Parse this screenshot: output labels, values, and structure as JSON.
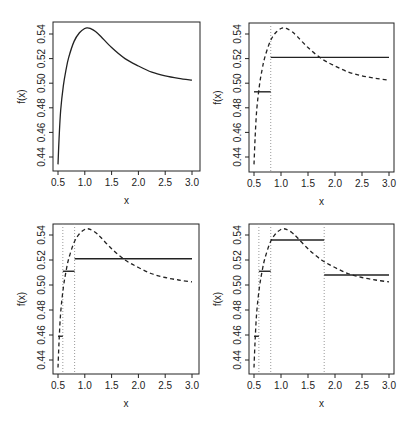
{
  "figure": {
    "layout": "2x2 grid of panels",
    "xlabel": "x",
    "ylabel": "f(x)"
  },
  "chart_data": [
    {
      "type": "line",
      "panel": "top-left",
      "title": "",
      "xlabel": "x",
      "ylabel": "f(x)",
      "xlim": [
        0.5,
        3.0
      ],
      "ylim": [
        0.433,
        0.548
      ],
      "xticks": [
        0.5,
        1.0,
        1.5,
        2.0,
        2.5,
        3.0
      ],
      "xtick_labels": [
        "0.5",
        "1.0",
        "1.5",
        "2.0",
        "2.5",
        "3.0"
      ],
      "yticks": [
        0.44,
        0.46,
        0.48,
        0.5,
        0.52,
        0.54
      ],
      "ytick_labels": [
        "0.44",
        "0.46",
        "0.48",
        "0.50",
        "0.52",
        "0.54"
      ],
      "grid": false,
      "curve_style": "solid",
      "curve": {
        "x": [
          0.5,
          0.52,
          0.55,
          0.6,
          0.65,
          0.7,
          0.8,
          0.9,
          1.0,
          1.05,
          1.1,
          1.2,
          1.3,
          1.5,
          1.75,
          2.0,
          2.25,
          2.5,
          2.75,
          3.0
        ],
        "y": [
          0.434,
          0.455,
          0.478,
          0.498,
          0.511,
          0.521,
          0.534,
          0.541,
          0.5445,
          0.545,
          0.5445,
          0.542,
          0.538,
          0.529,
          0.52,
          0.514,
          0.509,
          0.506,
          0.504,
          0.5025
        ]
      },
      "breaks": [],
      "steps": []
    },
    {
      "type": "line",
      "panel": "top-right",
      "title": "",
      "xlabel": "x",
      "ylabel": "f(x)",
      "xlim": [
        0.5,
        3.0
      ],
      "ylim": [
        0.433,
        0.548
      ],
      "xticks": [
        0.5,
        1.0,
        1.5,
        2.0,
        2.5,
        3.0
      ],
      "xtick_labels": [
        "0.5",
        "1.0",
        "1.5",
        "2.0",
        "2.5",
        "3.0"
      ],
      "yticks": [
        0.44,
        0.46,
        0.48,
        0.5,
        0.52,
        0.54
      ],
      "ytick_labels": [
        "0.44",
        "0.46",
        "0.48",
        "0.50",
        "0.52",
        "0.54"
      ],
      "grid": false,
      "curve_style": "dashed",
      "curve": {
        "x": [
          0.5,
          0.52,
          0.55,
          0.6,
          0.65,
          0.7,
          0.8,
          0.9,
          1.0,
          1.05,
          1.1,
          1.2,
          1.3,
          1.5,
          1.75,
          2.0,
          2.25,
          2.5,
          2.75,
          3.0
        ],
        "y": [
          0.434,
          0.455,
          0.478,
          0.498,
          0.511,
          0.521,
          0.534,
          0.541,
          0.5445,
          0.545,
          0.5445,
          0.542,
          0.538,
          0.529,
          0.52,
          0.514,
          0.509,
          0.506,
          0.504,
          0.5025
        ]
      },
      "breaks": [
        0.81
      ],
      "steps": [
        {
          "x0": 0.5,
          "x1": 0.81,
          "y": 0.493
        },
        {
          "x0": 0.81,
          "x1": 3.0,
          "y": 0.521
        }
      ]
    },
    {
      "type": "line",
      "panel": "bottom-left",
      "title": "",
      "xlabel": "x",
      "ylabel": "f(x)",
      "xlim": [
        0.5,
        3.0
      ],
      "ylim": [
        0.433,
        0.548
      ],
      "xticks": [
        0.5,
        1.0,
        1.5,
        2.0,
        2.5,
        3.0
      ],
      "xtick_labels": [
        "0.5",
        "1.0",
        "1.5",
        "2.0",
        "2.5",
        "3.0"
      ],
      "yticks": [
        0.44,
        0.46,
        0.48,
        0.5,
        0.52,
        0.54
      ],
      "ytick_labels": [
        "0.44",
        "0.46",
        "0.48",
        "0.50",
        "0.52",
        "0.54"
      ],
      "grid": false,
      "curve_style": "dashed",
      "curve": {
        "x": [
          0.5,
          0.52,
          0.55,
          0.6,
          0.65,
          0.7,
          0.8,
          0.9,
          1.0,
          1.05,
          1.1,
          1.2,
          1.3,
          1.5,
          1.75,
          2.0,
          2.25,
          2.5,
          2.75,
          3.0
        ],
        "y": [
          0.434,
          0.455,
          0.478,
          0.498,
          0.511,
          0.521,
          0.534,
          0.541,
          0.5445,
          0.545,
          0.5445,
          0.542,
          0.538,
          0.529,
          0.52,
          0.514,
          0.509,
          0.506,
          0.504,
          0.5025
        ]
      },
      "breaks": [
        0.59,
        0.81
      ],
      "steps": [
        {
          "x0": 0.5,
          "x1": 0.59,
          "y": 0.459
        },
        {
          "x0": 0.59,
          "x1": 0.81,
          "y": 0.511
        },
        {
          "x0": 0.81,
          "x1": 3.0,
          "y": 0.521
        }
      ]
    },
    {
      "type": "line",
      "panel": "bottom-right",
      "title": "",
      "xlabel": "x",
      "ylabel": "f(x)",
      "xlim": [
        0.5,
        3.0
      ],
      "ylim": [
        0.433,
        0.548
      ],
      "xticks": [
        0.5,
        1.0,
        1.5,
        2.0,
        2.5,
        3.0
      ],
      "xtick_labels": [
        "0.5",
        "1.0",
        "1.5",
        "2.0",
        "2.5",
        "3.0"
      ],
      "yticks": [
        0.44,
        0.46,
        0.48,
        0.5,
        0.52,
        0.54
      ],
      "ytick_labels": [
        "0.44",
        "0.46",
        "0.48",
        "0.50",
        "0.52",
        "0.54"
      ],
      "grid": false,
      "curve_style": "dashed",
      "curve": {
        "x": [
          0.5,
          0.52,
          0.55,
          0.6,
          0.65,
          0.7,
          0.8,
          0.9,
          1.0,
          1.05,
          1.1,
          1.2,
          1.3,
          1.5,
          1.75,
          2.0,
          2.25,
          2.5,
          2.75,
          3.0
        ],
        "y": [
          0.434,
          0.455,
          0.478,
          0.498,
          0.511,
          0.521,
          0.534,
          0.541,
          0.5445,
          0.545,
          0.5445,
          0.542,
          0.538,
          0.529,
          0.52,
          0.514,
          0.509,
          0.506,
          0.504,
          0.5025
        ]
      },
      "breaks": [
        0.59,
        0.81,
        1.8
      ],
      "steps": [
        {
          "x0": 0.5,
          "x1": 0.59,
          "y": 0.459
        },
        {
          "x0": 0.59,
          "x1": 0.81,
          "y": 0.511
        },
        {
          "x0": 0.81,
          "x1": 1.8,
          "y": 0.536
        },
        {
          "x0": 1.8,
          "x1": 3.0,
          "y": 0.508
        }
      ]
    }
  ],
  "panel_geometry": [
    {
      "box": [
        53,
        22,
        200,
        171
      ],
      "x_px": [
        58,
        192
      ],
      "y_px": [
        157,
        34
      ]
    },
    {
      "box": [
        249,
        23,
        394,
        172
      ],
      "x_px": [
        254,
        389
      ],
      "y_px": [
        157,
        34
      ]
    },
    {
      "box": [
        53,
        224,
        199,
        374
      ],
      "x_px": [
        58,
        192
      ],
      "y_px": [
        360,
        235
      ]
    },
    {
      "box": [
        249,
        224,
        394,
        374
      ],
      "x_px": [
        254,
        389
      ],
      "y_px": [
        360,
        235
      ]
    }
  ]
}
